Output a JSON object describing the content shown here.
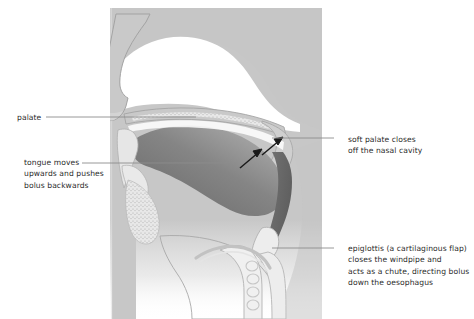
{
  "diagram": {
    "palette": {
      "page_background": "#ffffff",
      "panel_background": "#c9c9c9",
      "tissue_fill": "#c6c6c6",
      "tissue_outline": "#9a9a9a",
      "cavity_white": "#ffffff",
      "bolus_dark": "#808080",
      "pharynx_dark": "#6e6e6e",
      "stipple": "#bdbdbd",
      "arrow": "#1a1a1a",
      "leader_line": "#8c8c8c",
      "text": "#2b2b2b"
    }
  },
  "labels": {
    "palate": {
      "name": "palate",
      "lines": [
        "palate"
      ]
    },
    "tongue": {
      "name": "tongue-movement",
      "lines": [
        "tongue moves",
        "upwards and pushes",
        "bolus backwards"
      ]
    },
    "soft_palate": {
      "name": "soft-palate",
      "lines": [
        "soft palate closes",
        "off the nasal cavity"
      ]
    },
    "epiglottis": {
      "name": "epiglottis",
      "lines": [
        "epiglottis (a cartilaginous flap)",
        "closes the windpipe and",
        "acts as a chute, directing bolus",
        "down the oesophagus"
      ]
    }
  },
  "annotations": {
    "arrows": [
      {
        "name": "bolus-arrow-lower",
        "direction": "up-right"
      },
      {
        "name": "soft-palate-arrow-upper",
        "direction": "up-right"
      }
    ]
  }
}
